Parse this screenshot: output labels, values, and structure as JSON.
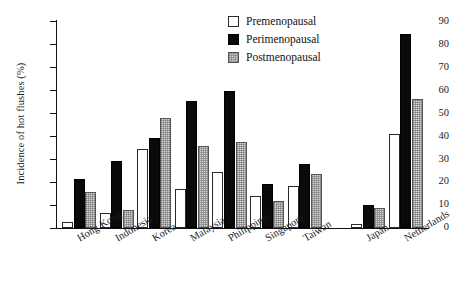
{
  "chart_data": {
    "type": "bar",
    "title": "",
    "xlabel": "",
    "ylabel": "Incidence of hot flushes (%)",
    "ylim": [
      0,
      90
    ],
    "yticks": [
      0,
      10,
      20,
      30,
      40,
      50,
      60,
      70,
      80,
      90
    ],
    "grid": false,
    "legend_position": "top-right",
    "categories": [
      "Hong Kong",
      "Indonesia",
      "Korea",
      "Malaysia",
      "Philippines",
      "Singapore",
      "Taiwan",
      "Japan",
      "Netherlands"
    ],
    "series": [
      {
        "name": "Premenopausal",
        "color": "#ffffff",
        "values": [
          3,
          6.5,
          34.5,
          17,
          24.5,
          14,
          18.5,
          2,
          41
        ]
      },
      {
        "name": "Perimenopausal",
        "color": "#0a0a0a",
        "values": [
          21.5,
          29.5,
          39.5,
          55.5,
          60,
          19.5,
          28,
          10,
          84.5
        ]
      },
      {
        "name": "Postmenopausal",
        "color": "#d6d6d6",
        "values": [
          16,
          8,
          48,
          36,
          37.5,
          12,
          23.5,
          9,
          56.5
        ]
      }
    ],
    "gap_after_category": "Taiwan"
  },
  "legend": {
    "items": [
      {
        "label": "Premenopausal"
      },
      {
        "label": "Perimenopausal"
      },
      {
        "label": "Postmenopausal"
      }
    ]
  }
}
